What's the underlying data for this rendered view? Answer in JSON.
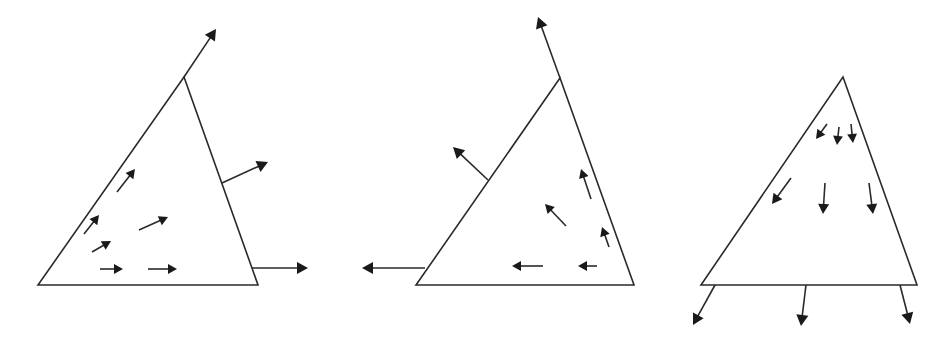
{
  "colors": {
    "stroke": "#2a2a2a",
    "head": "#1a1a1a",
    "background": "#ffffff"
  },
  "panels": [
    {
      "name": "panel-1",
      "triangle": [
        [
          38,
          285
        ],
        [
          184,
          77
        ],
        [
          258,
          285
        ]
      ],
      "arrows": [
        {
          "role": "boundary",
          "from": [
            184,
            77
          ],
          "to": [
            216,
            29
          ],
          "head": 11
        },
        {
          "role": "boundary",
          "from": [
            222,
            183
          ],
          "to": [
            268,
            162
          ],
          "head": 11
        },
        {
          "role": "boundary",
          "from": [
            252,
            268
          ],
          "to": [
            308,
            268
          ],
          "head": 11
        },
        {
          "role": "interior",
          "from": [
            117,
            192
          ],
          "to": [
            135,
            169
          ],
          "head": 9
        },
        {
          "role": "interior",
          "from": [
            84,
            234
          ],
          "to": [
            99,
            215
          ],
          "head": 9
        },
        {
          "role": "interior",
          "from": [
            139,
            230
          ],
          "to": [
            168,
            217
          ],
          "head": 9
        },
        {
          "role": "interior",
          "from": [
            92,
            252
          ],
          "to": [
            111,
            241
          ],
          "head": 9
        },
        {
          "role": "interior",
          "from": [
            100,
            269
          ],
          "to": [
            123,
            269
          ],
          "head": 9
        },
        {
          "role": "interior",
          "from": [
            148,
            269
          ],
          "to": [
            177,
            269
          ],
          "head": 9
        }
      ]
    },
    {
      "name": "panel-2",
      "triangle": [
        [
          416,
          285
        ],
        [
          560,
          78
        ],
        [
          634,
          285
        ]
      ],
      "arrows": [
        {
          "role": "boundary",
          "from": [
            560,
            78
          ],
          "to": [
            538,
            17
          ],
          "head": 11
        },
        {
          "role": "boundary",
          "from": [
            488,
            180
          ],
          "to": [
            453,
            147
          ],
          "head": 11
        },
        {
          "role": "boundary",
          "from": [
            425,
            268
          ],
          "to": [
            362,
            268
          ],
          "head": 11
        },
        {
          "role": "interior",
          "from": [
            591,
            199
          ],
          "to": [
            581,
            169
          ],
          "head": 9
        },
        {
          "role": "interior",
          "from": [
            566,
            226
          ],
          "to": [
            545,
            204
          ],
          "head": 9
        },
        {
          "role": "interior",
          "from": [
            609,
            247
          ],
          "to": [
            602,
            227
          ],
          "head": 9
        },
        {
          "role": "interior",
          "from": [
            543,
            266
          ],
          "to": [
            512,
            266
          ],
          "head": 9
        },
        {
          "role": "interior",
          "from": [
            597,
            266
          ],
          "to": [
            578,
            266
          ],
          "head": 9
        }
      ]
    },
    {
      "name": "panel-3",
      "triangle": [
        [
          701,
          285
        ],
        [
          843,
          77
        ],
        [
          917,
          285
        ]
      ],
      "arrows": [
        {
          "role": "boundary",
          "from": [
            715,
            285
          ],
          "to": [
            693,
            325
          ],
          "head": 11
        },
        {
          "role": "boundary",
          "from": [
            806,
            285
          ],
          "to": [
            801,
            326
          ],
          "head": 11
        },
        {
          "role": "boundary",
          "from": [
            900,
            285
          ],
          "to": [
            910,
            324
          ],
          "head": 11
        },
        {
          "role": "interior",
          "from": [
            827,
            124
          ],
          "to": [
            816,
            139
          ],
          "head": 9
        },
        {
          "role": "interior",
          "from": [
            839,
            127
          ],
          "to": [
            837,
            145
          ],
          "head": 9
        },
        {
          "role": "interior",
          "from": [
            851,
            124
          ],
          "to": [
            853,
            143
          ],
          "head": 9
        },
        {
          "role": "interior",
          "from": [
            791,
            178
          ],
          "to": [
            772,
            204
          ],
          "head": 10
        },
        {
          "role": "interior",
          "from": [
            825,
            183
          ],
          "to": [
            823,
            214
          ],
          "head": 10
        },
        {
          "role": "interior",
          "from": [
            869,
            183
          ],
          "to": [
            873,
            214
          ],
          "head": 10
        }
      ]
    }
  ]
}
